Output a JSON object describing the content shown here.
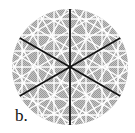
{
  "figure": {
    "label": "b.",
    "circle": {
      "cx": 70,
      "cy": 67,
      "r": 58
    },
    "colors": {
      "fill_dark": "#9a9a9a",
      "fill_light": "#c4c4c4",
      "lattice": "#ffffff",
      "mirror_lines": "#111111",
      "background": "#ffffff"
    },
    "mirror_line_angles_deg": [
      90,
      30,
      150
    ],
    "lattice_angles_deg": [
      0,
      30,
      60,
      90,
      120,
      150
    ],
    "lattice_spacing_px": 16
  }
}
